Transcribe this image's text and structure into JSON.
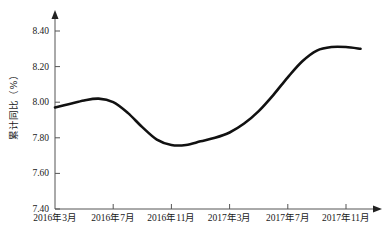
{
  "chart_data": {
    "type": "line",
    "title": "",
    "subtitle": "",
    "xlabel": "",
    "ylabel": "累计同比（%）",
    "ylim": [
      7.4,
      8.4
    ],
    "xlim": [
      0,
      21
    ],
    "grid": false,
    "legend": null,
    "y_ticks": [
      "8.40",
      "8.20",
      "8.00",
      "7.80",
      "7.60",
      "7.40"
    ],
    "y_tick_values": [
      8.4,
      8.2,
      8.0,
      7.8,
      7.6,
      7.4
    ],
    "x_ticks": [
      "2016年3月",
      "2016年7月",
      "2016年11月",
      "2017年3月",
      "2017年7月",
      "2017年11月"
    ],
    "x_tick_positions": [
      0,
      4,
      8,
      12,
      16,
      20
    ],
    "line_color": "#111111",
    "axis_color": "#555555",
    "series": [
      {
        "name": "累计同比",
        "x": [
          0,
          1,
          2,
          3,
          4,
          5,
          6,
          7,
          8,
          9,
          10,
          11,
          12,
          13,
          14,
          15,
          16,
          17,
          18,
          19,
          20,
          21
        ],
        "values": [
          7.97,
          7.99,
          8.01,
          8.02,
          8.0,
          7.94,
          7.86,
          7.79,
          7.76,
          7.76,
          7.78,
          7.8,
          7.83,
          7.88,
          7.95,
          8.04,
          8.14,
          8.23,
          8.29,
          8.31,
          8.31,
          8.3
        ]
      }
    ]
  },
  "axis": {
    "y_arrow": "arrow-up",
    "x_arrow": "arrow-right"
  }
}
